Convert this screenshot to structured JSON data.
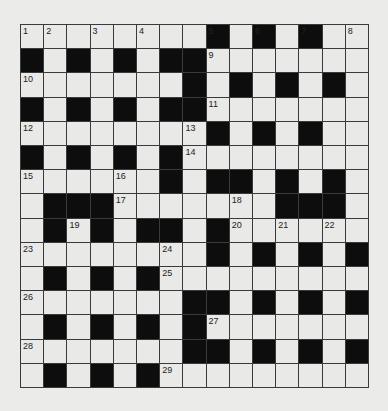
{
  "puzzle": {
    "rows": 15,
    "cols": 15,
    "colors": {
      "background": "#ebebea",
      "white_cell": "#e9e9e8",
      "black_cell": "#0d0d0d",
      "grid_line": "#3a3a3a",
      "number_text": "#222222"
    },
    "grid": [
      "........#.#.#..",
      "#.#.#.##.......",
      ".......#.#.#.#.",
      "#.#.#.##.......",
      "........#.#.#..",
      "#.#.#.#........",
      "......#.##.#.#.",
      ".###.......###.",
      ".#.#.##.#......",
      "........#.#.#.#",
      ".#.#.#.........",
      ".......##.#.#.#",
      ".#.#.#.#.......",
      ".......##.#.#.#",
      ".#.#.#........."
    ],
    "numbers": [
      {
        "row": 0,
        "col": 0,
        "label": "1"
      },
      {
        "row": 0,
        "col": 1,
        "label": "2"
      },
      {
        "row": 0,
        "col": 3,
        "label": "3"
      },
      {
        "row": 0,
        "col": 5,
        "label": "4"
      },
      {
        "row": 0,
        "col": 8,
        "label": "5"
      },
      {
        "row": 0,
        "col": 10,
        "label": "6"
      },
      {
        "row": 0,
        "col": 12,
        "label": "7"
      },
      {
        "row": 0,
        "col": 14,
        "label": "8"
      },
      {
        "row": 1,
        "col": 8,
        "label": "9"
      },
      {
        "row": 2,
        "col": 0,
        "label": "10"
      },
      {
        "row": 3,
        "col": 8,
        "label": "11"
      },
      {
        "row": 4,
        "col": 0,
        "label": "12"
      },
      {
        "row": 4,
        "col": 7,
        "label": "13"
      },
      {
        "row": 5,
        "col": 7,
        "label": "14"
      },
      {
        "row": 6,
        "col": 0,
        "label": "15"
      },
      {
        "row": 6,
        "col": 4,
        "label": "16"
      },
      {
        "row": 7,
        "col": 4,
        "label": "17"
      },
      {
        "row": 7,
        "col": 9,
        "label": "18"
      },
      {
        "row": 8,
        "col": 2,
        "label": "19"
      },
      {
        "row": 8,
        "col": 9,
        "label": "20"
      },
      {
        "row": 8,
        "col": 11,
        "label": "21"
      },
      {
        "row": 8,
        "col": 13,
        "label": "22"
      },
      {
        "row": 9,
        "col": 0,
        "label": "23"
      },
      {
        "row": 9,
        "col": 6,
        "label": "24"
      },
      {
        "row": 10,
        "col": 6,
        "label": "25"
      },
      {
        "row": 11,
        "col": 0,
        "label": "26"
      },
      {
        "row": 12,
        "col": 8,
        "label": "27"
      },
      {
        "row": 13,
        "col": 0,
        "label": "28"
      },
      {
        "row": 14,
        "col": 6,
        "label": "29"
      }
    ]
  }
}
